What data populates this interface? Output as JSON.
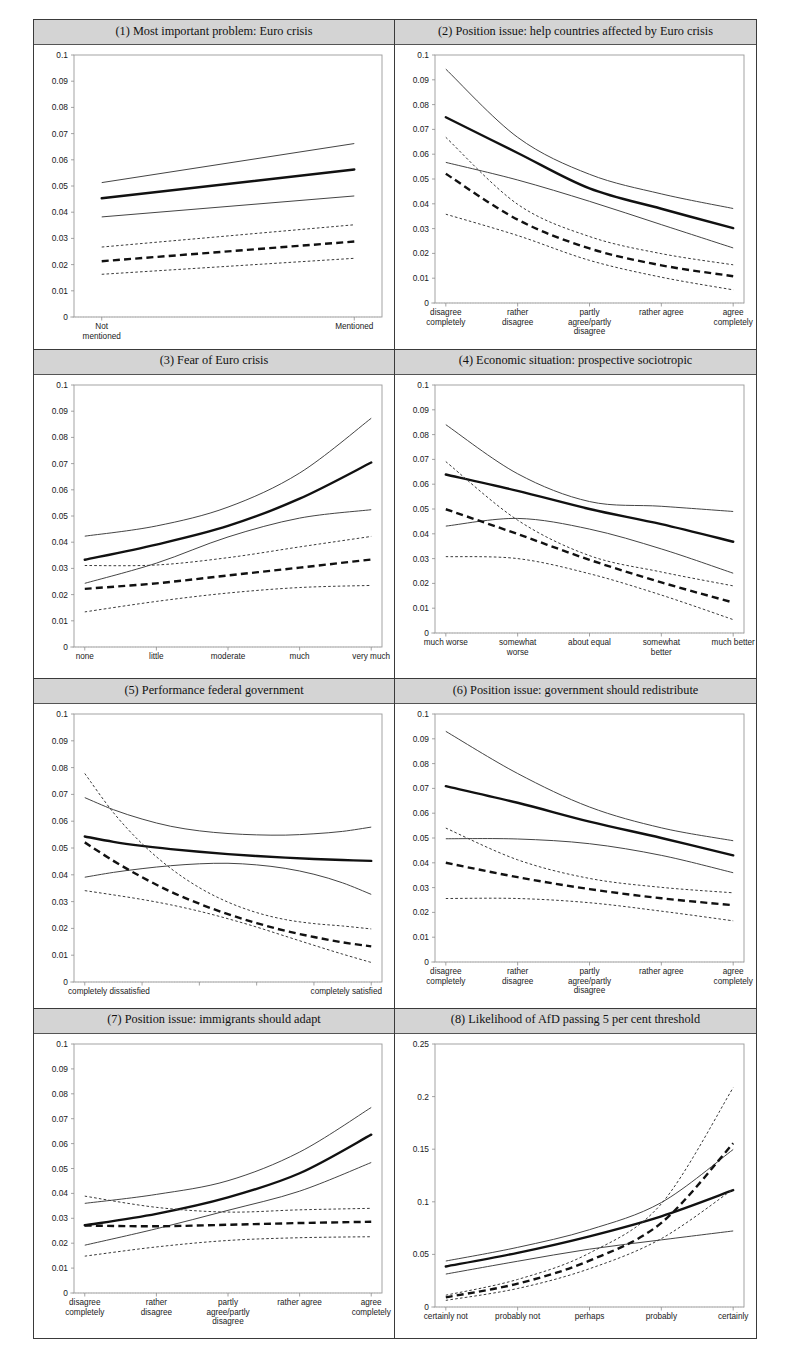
{
  "figure": {
    "panel_count": 8,
    "series_names": [
      "AfD mean (solid)",
      "AfD CI upper (thin solid)",
      "AfD CI lower (thin solid)",
      "Other mean (dashed)",
      "Other CI upper (dotted)",
      "Other CI lower (dotted)"
    ]
  },
  "chart_data": [
    {
      "type": "line",
      "title": "(1) Most important problem: Euro crisis",
      "categories": [
        "Not mentioned",
        "Mentioned"
      ],
      "xlabel": "",
      "ylabel": "",
      "ylim": [
        0,
        0.1
      ],
      "yticks": [
        "0",
        "0.01",
        "0.02",
        "0.03",
        "0.04",
        "0.05",
        "0.06",
        "0.07",
        "0.08",
        "0.09",
        "0.1"
      ],
      "grid": false,
      "legend": "none",
      "series": [
        {
          "name": "mean-solid",
          "style": "solid-thick",
          "values": [
            0.0453,
            0.0563
          ]
        },
        {
          "name": "ci-upper-solid",
          "style": "solid-thin",
          "values": [
            0.0513,
            0.0662
          ]
        },
        {
          "name": "ci-lower-solid",
          "style": "solid-thin",
          "values": [
            0.0382,
            0.0462
          ]
        },
        {
          "name": "mean-dashed",
          "style": "dashed-thick",
          "values": [
            0.0213,
            0.0288
          ]
        },
        {
          "name": "ci-upper-dotted",
          "style": "dotted-thin",
          "values": [
            0.0267,
            0.0352
          ]
        },
        {
          "name": "ci-lower-dotted",
          "style": "dotted-thin",
          "values": [
            0.0163,
            0.0224
          ]
        }
      ]
    },
    {
      "type": "line",
      "title": "(2) Position issue: help countries affected by Euro crisis",
      "categories": [
        "disagree completely",
        "rather disagree",
        "partly agree/partly disagree",
        "rather agree",
        "agree completely"
      ],
      "xlabel": "",
      "ylabel": "",
      "ylim": [
        0,
        0.1
      ],
      "yticks": [
        "0",
        "0.01",
        "0.02",
        "0.03",
        "0.04",
        "0.05",
        "0.06",
        "0.07",
        "0.08",
        "0.09",
        "0.1"
      ],
      "grid": false,
      "legend": "none",
      "series": [
        {
          "name": "mean-solid",
          "style": "solid-thick",
          "values": [
            0.0749,
            0.0605,
            0.0462,
            0.038,
            0.0302
          ]
        },
        {
          "name": "ci-upper-solid",
          "style": "solid-thin",
          "values": [
            0.0943,
            0.0668,
            0.0519,
            0.044,
            0.0381
          ]
        },
        {
          "name": "ci-lower-solid",
          "style": "solid-thin",
          "values": [
            0.0567,
            0.0496,
            0.041,
            0.0316,
            0.0222
          ]
        },
        {
          "name": "mean-dashed",
          "style": "dashed-thick",
          "values": [
            0.0521,
            0.0336,
            0.022,
            0.0152,
            0.0108
          ]
        },
        {
          "name": "ci-upper-dotted",
          "style": "dotted-thin",
          "values": [
            0.0668,
            0.0398,
            0.0268,
            0.0199,
            0.0154
          ]
        },
        {
          "name": "ci-lower-dotted",
          "style": "dotted-thin",
          "values": [
            0.0358,
            0.0272,
            0.0172,
            0.0104,
            0.0053
          ]
        }
      ]
    },
    {
      "type": "line",
      "title": "(3) Fear of Euro crisis",
      "categories": [
        "none",
        "little",
        "moderate",
        "much",
        "very much"
      ],
      "xlabel": "",
      "ylabel": "",
      "ylim": [
        0,
        0.1
      ],
      "yticks": [
        "0",
        "0.01",
        "0.02",
        "0.03",
        "0.04",
        "0.05",
        "0.06",
        "0.07",
        "0.08",
        "0.09",
        "0.1"
      ],
      "grid": false,
      "legend": "none",
      "series": [
        {
          "name": "mean-solid",
          "style": "solid-thick",
          "values": [
            0.0333,
            0.0391,
            0.0462,
            0.0566,
            0.0704
          ]
        },
        {
          "name": "ci-upper-solid",
          "style": "solid-thin",
          "values": [
            0.0423,
            0.0462,
            0.0534,
            0.0664,
            0.0873
          ]
        },
        {
          "name": "ci-lower-solid",
          "style": "solid-thin",
          "values": [
            0.0243,
            0.032,
            0.042,
            0.0492,
            0.0524
          ]
        },
        {
          "name": "mean-dashed",
          "style": "dashed-thick",
          "values": [
            0.0222,
            0.0243,
            0.0273,
            0.0303,
            0.0334
          ]
        },
        {
          "name": "ci-upper-dotted",
          "style": "dotted-thin",
          "values": [
            0.0311,
            0.0313,
            0.0341,
            0.0382,
            0.0422
          ]
        },
        {
          "name": "ci-lower-dotted",
          "style": "dotted-thin",
          "values": [
            0.0134,
            0.0174,
            0.0206,
            0.0227,
            0.0235
          ]
        }
      ]
    },
    {
      "type": "line",
      "title": "(4) Economic situation: prospective sociotropic",
      "categories": [
        "much worse",
        "somewhat worse",
        "about equal",
        "somewhat better",
        "much better"
      ],
      "xlabel": "",
      "ylabel": "",
      "ylim": [
        0,
        0.1
      ],
      "yticks": [
        "0",
        "0.01",
        "0.02",
        "0.03",
        "0.04",
        "0.05",
        "0.06",
        "0.07",
        "0.08",
        "0.09",
        "0.1"
      ],
      "grid": false,
      "legend": "none",
      "series": [
        {
          "name": "mean-solid",
          "style": "solid-thick",
          "values": [
            0.0639,
            0.0573,
            0.05,
            0.0439,
            0.0368
          ]
        },
        {
          "name": "ci-upper-solid",
          "style": "solid-thin",
          "values": [
            0.084,
            0.0642,
            0.053,
            0.0511,
            0.049
          ]
        },
        {
          "name": "ci-lower-solid",
          "style": "solid-thin",
          "values": [
            0.0431,
            0.0462,
            0.0419,
            0.0339,
            0.0241
          ]
        },
        {
          "name": "mean-dashed",
          "style": "dashed-thick",
          "values": [
            0.0499,
            0.0399,
            0.0295,
            0.0204,
            0.0123
          ]
        },
        {
          "name": "ci-upper-dotted",
          "style": "dotted-thin",
          "values": [
            0.0691,
            0.0455,
            0.0312,
            0.0246,
            0.019
          ]
        },
        {
          "name": "ci-lower-dotted",
          "style": "dotted-thin",
          "values": [
            0.0308,
            0.03,
            0.0239,
            0.0153,
            0.0054
          ]
        }
      ]
    },
    {
      "type": "line",
      "title": "(5) Performance federal government",
      "categories": [
        "completely dissatisfied",
        "",
        "",
        "",
        "",
        "",
        "",
        "",
        "",
        "",
        "completely satisfied"
      ],
      "xlabel": "",
      "ylabel": "",
      "ylim": [
        0,
        0.1
      ],
      "yticks": [
        "0",
        "0.01",
        "0.02",
        "0.03",
        "0.04",
        "0.05",
        "0.06",
        "0.07",
        "0.08",
        "0.09",
        "0.1"
      ],
      "grid": false,
      "legend": "none",
      "series": [
        {
          "name": "mean-solid",
          "style": "solid-thick",
          "values": [
            0.0543,
            0.0523,
            0.0508,
            0.0496,
            0.0486,
            0.0477,
            0.047,
            0.0464,
            0.0459,
            0.0455,
            0.0452
          ]
        },
        {
          "name": "ci-upper-solid",
          "style": "solid-thin",
          "values": [
            0.0688,
            0.0643,
            0.0608,
            0.0581,
            0.0564,
            0.0554,
            0.0549,
            0.0548,
            0.0553,
            0.0562,
            0.0578
          ]
        },
        {
          "name": "ci-lower-solid",
          "style": "solid-thin",
          "values": [
            0.0391,
            0.0409,
            0.0423,
            0.0434,
            0.0441,
            0.0443,
            0.0437,
            0.0424,
            0.0402,
            0.037,
            0.0327
          ]
        },
        {
          "name": "mean-dashed",
          "style": "dashed-thick",
          "values": [
            0.0521,
            0.0452,
            0.0391,
            0.0337,
            0.0292,
            0.0253,
            0.022,
            0.0191,
            0.0168,
            0.0148,
            0.0133
          ]
        },
        {
          "name": "ci-upper-dotted",
          "style": "dotted-thin",
          "values": [
            0.0778,
            0.0632,
            0.0516,
            0.0424,
            0.0352,
            0.0298,
            0.0259,
            0.0233,
            0.0218,
            0.0209,
            0.0198
          ]
        },
        {
          "name": "ci-lower-dotted",
          "style": "dotted-thin",
          "values": [
            0.0341,
            0.0325,
            0.0308,
            0.0288,
            0.0264,
            0.0236,
            0.0205,
            0.0171,
            0.0137,
            0.0104,
            0.0073
          ]
        }
      ]
    },
    {
      "type": "line",
      "title": "(6) Position issue: government should redistribute",
      "categories": [
        "disagree completely",
        "rather disagree",
        "partly agree/partly disagree",
        "rather agree",
        "agree completely"
      ],
      "xlabel": "",
      "ylabel": "",
      "ylim": [
        0,
        0.1
      ],
      "yticks": [
        "0",
        "0.01",
        "0.02",
        "0.03",
        "0.04",
        "0.05",
        "0.06",
        "0.07",
        "0.08",
        "0.09",
        "0.1"
      ],
      "grid": false,
      "legend": "none",
      "series": [
        {
          "name": "mean-solid",
          "style": "solid-thick",
          "values": [
            0.0709,
            0.0642,
            0.0566,
            0.05,
            0.043
          ]
        },
        {
          "name": "ci-upper-solid",
          "style": "solid-thin",
          "values": [
            0.093,
            0.076,
            0.0625,
            0.0541,
            0.0489
          ]
        },
        {
          "name": "ci-lower-solid",
          "style": "solid-thin",
          "values": [
            0.0497,
            0.0496,
            0.0477,
            0.043,
            0.036
          ]
        },
        {
          "name": "mean-dashed",
          "style": "dashed-thick",
          "values": [
            0.04,
            0.0342,
            0.0294,
            0.0257,
            0.0229
          ]
        },
        {
          "name": "ci-upper-dotted",
          "style": "dotted-thin",
          "values": [
            0.054,
            0.0412,
            0.0337,
            0.0301,
            0.0279
          ]
        },
        {
          "name": "ci-lower-dotted",
          "style": "dotted-thin",
          "values": [
            0.0256,
            0.0256,
            0.0239,
            0.0205,
            0.0166
          ]
        }
      ]
    },
    {
      "type": "line",
      "title": "(7) Position issue: immigrants should adapt",
      "categories": [
        "disagree completely",
        "rather disagree",
        "partly agree/partly disagree",
        "rather agree",
        "agree completely"
      ],
      "xlabel": "",
      "ylabel": "",
      "ylim": [
        0,
        0.1
      ],
      "yticks": [
        "0",
        "0.01",
        "0.02",
        "0.03",
        "0.04",
        "0.05",
        "0.06",
        "0.07",
        "0.08",
        "0.09",
        "0.1"
      ],
      "grid": false,
      "legend": "none",
      "series": [
        {
          "name": "mean-solid",
          "style": "solid-thick",
          "values": [
            0.0272,
            0.0318,
            0.0384,
            0.0481,
            0.0636
          ]
        },
        {
          "name": "ci-upper-solid",
          "style": "solid-thin",
          "values": [
            0.036,
            0.0396,
            0.0451,
            0.0566,
            0.0745
          ]
        },
        {
          "name": "ci-lower-solid",
          "style": "solid-thin",
          "values": [
            0.0192,
            0.0258,
            0.0332,
            0.0409,
            0.0524
          ]
        },
        {
          "name": "mean-dashed",
          "style": "dashed-thick",
          "values": [
            0.0271,
            0.0268,
            0.0274,
            0.0281,
            0.0286
          ]
        },
        {
          "name": "ci-upper-dotted",
          "style": "dotted-thin",
          "values": [
            0.0389,
            0.0344,
            0.0325,
            0.0334,
            0.034
          ]
        },
        {
          "name": "ci-lower-dotted",
          "style": "dotted-thin",
          "values": [
            0.0148,
            0.0185,
            0.0211,
            0.0222,
            0.0226
          ]
        }
      ]
    },
    {
      "type": "line",
      "title": "(8) Likelihood of AfD passing 5 per cent threshold",
      "categories": [
        "certainly not",
        "probably not",
        "perhaps",
        "probably",
        "certainly"
      ],
      "xlabel": "",
      "ylabel": "",
      "ylim": [
        0,
        0.25
      ],
      "yticks": [
        "0",
        "0.05",
        "0.1",
        "0.15",
        "0.2",
        "0.25"
      ],
      "grid": false,
      "legend": "none",
      "series": [
        {
          "name": "mean-solid",
          "style": "solid-thick",
          "values": [
            0.0385,
            0.0515,
            0.0672,
            0.0862,
            0.111
          ]
        },
        {
          "name": "ci-upper-solid",
          "style": "solid-thin",
          "values": [
            0.0437,
            0.0567,
            0.0735,
            0.0993,
            0.1497
          ]
        },
        {
          "name": "ci-lower-solid",
          "style": "solid-thin",
          "values": [
            0.0313,
            0.0435,
            0.055,
            0.0638,
            0.0723
          ]
        },
        {
          "name": "mean-dashed",
          "style": "dashed-thick",
          "values": [
            0.0092,
            0.0222,
            0.0441,
            0.08,
            0.1557
          ]
        },
        {
          "name": "ci-upper-dotted",
          "style": "dotted-thin",
          "values": [
            0.0112,
            0.0262,
            0.0513,
            0.0981,
            0.2085
          ]
        },
        {
          "name": "ci-lower-dotted",
          "style": "dotted-thin",
          "values": [
            0.0063,
            0.0176,
            0.0364,
            0.065,
            0.112
          ]
        }
      ]
    }
  ]
}
